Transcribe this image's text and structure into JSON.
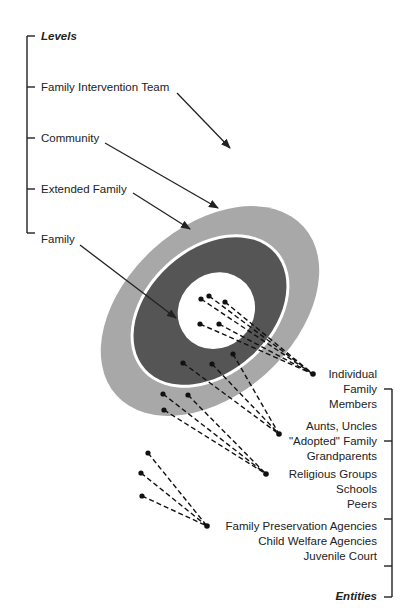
{
  "levels": {
    "title": "Levels",
    "items": [
      {
        "label": "Family Intervention Team"
      },
      {
        "label": "Community"
      },
      {
        "label": "Extended Family"
      },
      {
        "label": "Family"
      }
    ]
  },
  "entities": {
    "title": "Entities",
    "groups": [
      {
        "lines": [
          "Individual",
          "Family",
          "Members"
        ]
      },
      {
        "lines": [
          "Aunts, Uncles",
          "\"Adopted\" Family",
          "Grandparents"
        ]
      },
      {
        "lines": [
          "Religious Groups",
          "Schools",
          "Peers"
        ]
      },
      {
        "lines": [
          "Family Preservation Agencies",
          "Child Welfare Agencies",
          "Juvenile Court"
        ]
      }
    ]
  },
  "colors": {
    "community_ring": "#a8a8a8",
    "extended_family_ring": "#555555",
    "family_core": "#ffffff",
    "lines": "#222222"
  }
}
